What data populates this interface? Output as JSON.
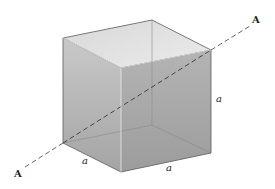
{
  "diagram": {
    "type": "3d-cube-with-axis",
    "axis": {
      "name": "A-A",
      "start_label": "A",
      "end_label": "A",
      "style": "dashed"
    },
    "edges": [
      {
        "id": "right-vertical-edge",
        "label": "a"
      },
      {
        "id": "bottom-left-edge",
        "label": "a"
      },
      {
        "id": "bottom-front-edge",
        "label": "a"
      }
    ],
    "colors": {
      "background": "#ffffff",
      "face_top": "#dedede",
      "face_left": "#bdbdbd",
      "face_front": "#a9a9a9",
      "edge": "#555555",
      "axis": "#444444",
      "label": "#222222"
    }
  }
}
